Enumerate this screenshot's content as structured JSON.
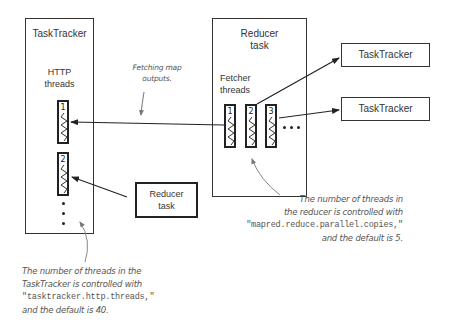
{
  "diagram": {
    "tasktracker_main": {
      "title": "TaskTracker",
      "http_threads_label_line1": "HTTP",
      "http_threads_label_line2": "threads",
      "threads": [
        {
          "number": "1"
        },
        {
          "number": "2"
        }
      ],
      "ellipsis": "•\n•\n•"
    },
    "reducer_main": {
      "title_line1": "Reducer",
      "title_line2": "task",
      "fetcher_label_line1": "Fetcher",
      "fetcher_label_line2": "threads",
      "threads": [
        {
          "number": "1"
        },
        {
          "number": "2"
        },
        {
          "number": "3"
        }
      ],
      "ellipsis": "•••"
    },
    "remote_tasktrackers": [
      {
        "label": "TaskTracker"
      },
      {
        "label": "TaskTracker"
      }
    ],
    "other_reducer": {
      "title_line1": "Reducer",
      "title_line2": "task"
    },
    "annotations": {
      "fetching": {
        "line1": "Fetching map",
        "line2": "outputs."
      },
      "tasktracker_note": {
        "line1": "The number of threads in the",
        "line2": "TaskTracker is controlled with",
        "line3_code": "\"tasktracker.http.threads,\"",
        "line4": "and the default is 40."
      },
      "reducer_note": {
        "line1": "The number of threads in",
        "line2": "the reducer is controlled with",
        "line3_code": "\"mapred.reduce.parallel.copies,\"",
        "line4": "and the default is 5."
      }
    }
  }
}
